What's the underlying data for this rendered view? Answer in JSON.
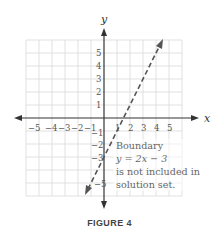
{
  "figure": {
    "caption": "FIGURE 4",
    "axes": {
      "x_label": "x",
      "y_label": "y",
      "x_ticks": [
        "−5",
        "−4",
        "−3",
        "−2",
        "−1",
        "1",
        "2",
        "3",
        "4",
        "5"
      ],
      "y_ticks": [
        "5",
        "4",
        "3",
        "2",
        "1",
        "−1",
        "−2",
        "−3",
        "−5"
      ],
      "x_range": [
        -6,
        6
      ],
      "y_range": [
        -6,
        6
      ],
      "grid": true
    },
    "boundary_line": {
      "equation": "y = 2x − 3",
      "style": "dashed",
      "color": "#555555"
    },
    "annotation": {
      "line1": "Boundary",
      "line2": "y = 2x − 3",
      "line3": "is not included in",
      "line4": "solution set."
    },
    "colors": {
      "grid": "#d6d6d6",
      "axis": "#333333",
      "text": "#666666"
    }
  }
}
